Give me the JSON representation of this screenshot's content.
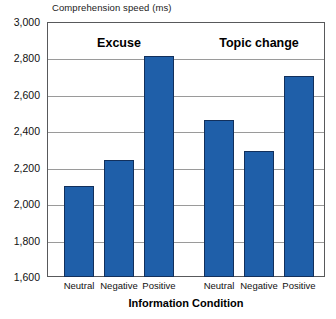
{
  "chart_data": {
    "type": "bar",
    "title": "",
    "xlabel": "Information Condition",
    "ylabel": "Comprehension speed (ms)",
    "ylim": [
      1600,
      3000
    ],
    "ytick_step": 200,
    "grid": true,
    "legend": "none",
    "categories": [
      "Neutral",
      "Negative",
      "Positive",
      "Neutral",
      "Negative",
      "Positive"
    ],
    "values": [
      2100,
      2240,
      2815,
      2460,
      2290,
      2705
    ],
    "ytick_labels": [
      "3,000",
      "2,800",
      "2,600",
      "2,400",
      "2,200",
      "2,000",
      "1,800",
      "1,600"
    ],
    "ytick_values": [
      3000,
      2800,
      2600,
      2400,
      2200,
      2000,
      1800,
      1600
    ],
    "annotations": [
      "Excuse",
      "Topic change"
    ],
    "groups": [
      {
        "label": "Excuse",
        "categories": [
          "Neutral",
          "Negative",
          "Positive"
        ],
        "values": [
          2100,
          2240,
          2815
        ]
      },
      {
        "label": "Topic change",
        "categories": [
          "Neutral",
          "Negative",
          "Positive"
        ],
        "values": [
          2460,
          2290,
          2705
        ]
      }
    ],
    "bar_color": "#1F5FA9",
    "bar_border_color": "#12305C",
    "gridline_color": "#9A9A9A",
    "axis_color": "#58595B"
  }
}
